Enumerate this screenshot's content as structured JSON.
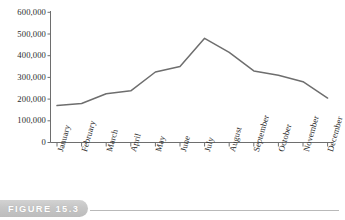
{
  "figure": {
    "caption_label": "FIGURE 15.3"
  },
  "chart_data": {
    "type": "line",
    "title": "",
    "subtitle": "",
    "xlabel": "",
    "ylabel": "",
    "categories": [
      "January",
      "February",
      "March",
      "April",
      "May",
      "June",
      "July",
      "August",
      "September",
      "October",
      "November",
      "December"
    ],
    "values": [
      170000,
      180000,
      225000,
      238000,
      325000,
      350000,
      480000,
      415000,
      330000,
      310000,
      280000,
      205000
    ],
    "series": [
      {
        "name": "",
        "values": [
          170000,
          180000,
          225000,
          238000,
          325000,
          350000,
          480000,
          415000,
          330000,
          310000,
          280000,
          205000
        ]
      }
    ],
    "ylim": [
      0,
      600000
    ],
    "ytick_values": [
      0,
      100000,
      200000,
      300000,
      400000,
      500000,
      600000
    ],
    "ytick_labels": [
      "0",
      "100,000",
      "200,000",
      "300,000",
      "400,000",
      "500,000",
      "600,000"
    ],
    "xtick_labels": [
      "January",
      "February",
      "March",
      "April",
      "May",
      "June",
      "July",
      "August",
      "September",
      "October",
      "November",
      "December"
    ],
    "grid": false,
    "legend": false,
    "legend_position": "none",
    "line_color": "#6e6e6e",
    "axis_color": "#6e6e6e",
    "text_color": "#2b2b2b"
  }
}
